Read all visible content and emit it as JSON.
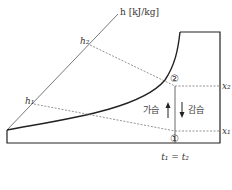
{
  "diagram": {
    "type": "psychrometric-chart",
    "axis_label": "h [kJ/kg]",
    "enthalpy_labels": {
      "h1": "h₁",
      "h2": "h₂"
    },
    "humidity_labels": {
      "x1": "x₁",
      "x2": "x₂"
    },
    "points": {
      "p1": "①",
      "p2": "②"
    },
    "humidify_label": "가습",
    "dehumidify_label": "감습",
    "temperature_label": "t₁ = t₂",
    "colors": {
      "line": "#333333",
      "dashed": "#666666",
      "frame": "#222222"
    }
  }
}
